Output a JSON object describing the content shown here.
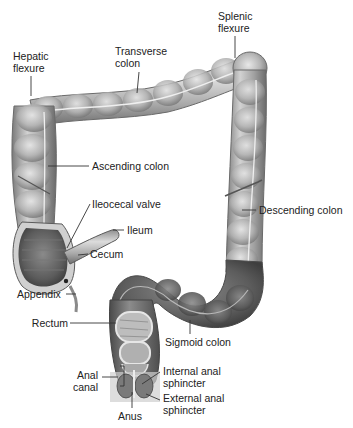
{
  "diagram": {
    "colors": {
      "tissue_dark": "#5a5a5a",
      "tissue_mid": "#9a9a9a",
      "tissue_light": "#d6d6d6",
      "leader_line": "#333333",
      "text": "#222222"
    },
    "labels": {
      "hepatic_flexure": [
        "Hepatic",
        "flexure"
      ],
      "transverse_colon": [
        "Transverse",
        "colon"
      ],
      "splenic_flexure": [
        "Splenic",
        "flexure"
      ],
      "ascending_colon": "Ascending colon",
      "ileocecal_valve": "Ileocecal valve",
      "ileum": "Ileum",
      "cecum": "Cecum",
      "descending_colon": "Descending colon",
      "appendix": "Appendix",
      "rectum": "Rectum",
      "sigmoid_colon": "Sigmoid colon",
      "anal_canal": [
        "Anal",
        "canal"
      ],
      "internal_anal_sphincter": [
        "Internal anal",
        "sphincter"
      ],
      "external_anal_sphincter": [
        "External anal",
        "sphincter"
      ],
      "anus": "Anus"
    }
  }
}
